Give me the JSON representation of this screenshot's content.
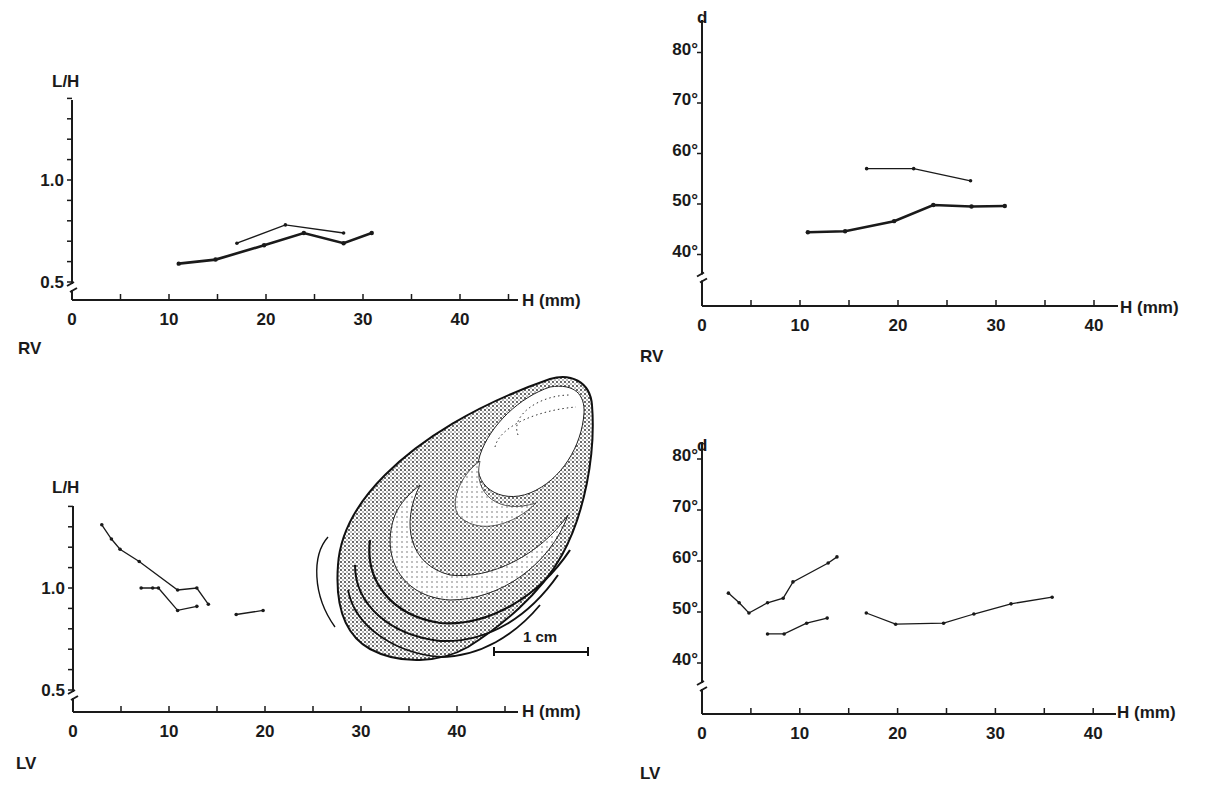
{
  "figure": {
    "panels": {
      "top_left": {
        "valve_label": "RV",
        "y_label": "L/H",
        "x_label": "H (mm)"
      },
      "top_right": {
        "valve_label": "RV",
        "y_label": "d",
        "x_label": "H (mm)"
      },
      "bottom_left": {
        "valve_label": "LV",
        "y_label": "L/H",
        "x_label": "H (mm)"
      },
      "bottom_right": {
        "valve_label": "LV",
        "y_label": "d",
        "x_label": "H (mm)"
      }
    },
    "illustration": {
      "subject": "oyster-shell-drawing",
      "scale_bar_label": "1 cm"
    }
  },
  "chart_data": [
    {
      "id": "top_left",
      "type": "line",
      "title": "",
      "panel_label": "RV",
      "xlabel": "H (mm)",
      "ylabel": "L/H",
      "xlim": [
        0,
        45
      ],
      "ylim": [
        0.5,
        1.4
      ],
      "x_ticks": [
        0,
        10,
        20,
        30,
        40
      ],
      "y_tick_labels": [
        "0.5",
        "1.0"
      ],
      "y_minor_step": 0.1,
      "axis_break_y": true,
      "grid": false,
      "series": [
        {
          "name": "series-thin",
          "style": "thin",
          "x": [
            17,
            22,
            28
          ],
          "y": [
            0.69,
            0.78,
            0.74
          ]
        },
        {
          "name": "series-thick",
          "style": "thick",
          "x": [
            11,
            14.8,
            19.8,
            23.9,
            28,
            30.9
          ],
          "y": [
            0.59,
            0.61,
            0.68,
            0.74,
            0.69,
            0.74
          ]
        }
      ]
    },
    {
      "id": "top_right",
      "type": "line",
      "title": "",
      "panel_label": "RV",
      "xlabel": "H (mm)",
      "ylabel": "d",
      "xlim": [
        0,
        42
      ],
      "ylim": [
        30,
        82
      ],
      "x_ticks": [
        0,
        10,
        20,
        30,
        40
      ],
      "y_tick_labels": [
        "40°",
        "50°",
        "60°",
        "70°",
        "80°"
      ],
      "y_ticks": [
        40,
        50,
        60,
        70,
        80
      ],
      "axis_break_y": true,
      "grid": false,
      "series": [
        {
          "name": "series-thin",
          "style": "thin",
          "x": [
            16.8,
            21.6,
            27.4
          ],
          "y": [
            57,
            57,
            54.6
          ]
        },
        {
          "name": "series-thick",
          "style": "thick",
          "x": [
            10.8,
            14.6,
            19.6,
            23.6,
            27.5,
            30.9
          ],
          "y": [
            44.4,
            44.6,
            46.6,
            49.8,
            49.5,
            49.6
          ]
        }
      ]
    },
    {
      "id": "bottom_left",
      "type": "line",
      "title": "",
      "panel_label": "LV",
      "xlabel": "H (mm)",
      "ylabel": "L/H",
      "xlim": [
        0,
        45
      ],
      "ylim": [
        0.5,
        1.4
      ],
      "x_ticks": [
        0,
        10,
        20,
        30,
        40
      ],
      "y_tick_labels": [
        "0.5",
        "1.0"
      ],
      "y_minor_step": 0.1,
      "axis_break_y": true,
      "grid": false,
      "series": [
        {
          "name": "series-a",
          "style": "thin",
          "x": [
            3,
            4,
            4.9,
            6.9,
            10.9,
            12.9,
            14.1
          ],
          "y": [
            1.31,
            1.24,
            1.19,
            1.13,
            0.99,
            1.0,
            0.92
          ]
        },
        {
          "name": "series-b",
          "style": "thin",
          "x": [
            7.1,
            8.3,
            8.9,
            10.9,
            12.9
          ],
          "y": [
            1.0,
            1.0,
            1.0,
            0.89,
            0.91
          ]
        },
        {
          "name": "series-c",
          "style": "thin",
          "x": [
            17,
            19.8
          ],
          "y": [
            0.87,
            0.89
          ]
        }
      ]
    },
    {
      "id": "bottom_right",
      "type": "line",
      "title": "",
      "panel_label": "LV",
      "xlabel": "H (mm)",
      "ylabel": "d",
      "xlim": [
        0,
        42
      ],
      "ylim": [
        30,
        82
      ],
      "x_ticks": [
        0,
        10,
        20,
        30,
        40
      ],
      "y_tick_labels": [
        "40°",
        "50°",
        "60°",
        "70°",
        "80°"
      ],
      "y_ticks": [
        40,
        50,
        60,
        70,
        80
      ],
      "axis_break_y": true,
      "grid": false,
      "series": [
        {
          "name": "series-a",
          "style": "thin",
          "x": [
            2.7,
            3.8,
            4.8,
            6.7,
            8.3,
            9.3,
            12.9,
            13.8
          ],
          "y": [
            53.7,
            51.8,
            49.8,
            51.8,
            52.7,
            55.9,
            59.6,
            60.8
          ]
        },
        {
          "name": "series-b",
          "style": "thin",
          "x": [
            6.7,
            8.4,
            10.7,
            12.8
          ],
          "y": [
            45.7,
            45.7,
            47.8,
            48.8
          ]
        },
        {
          "name": "series-c",
          "style": "thin",
          "x": [
            16.8,
            19.8,
            24.7,
            27.8,
            31.6,
            35.8
          ],
          "y": [
            49.8,
            47.6,
            47.8,
            49.6,
            51.6,
            52.9
          ]
        }
      ]
    }
  ]
}
